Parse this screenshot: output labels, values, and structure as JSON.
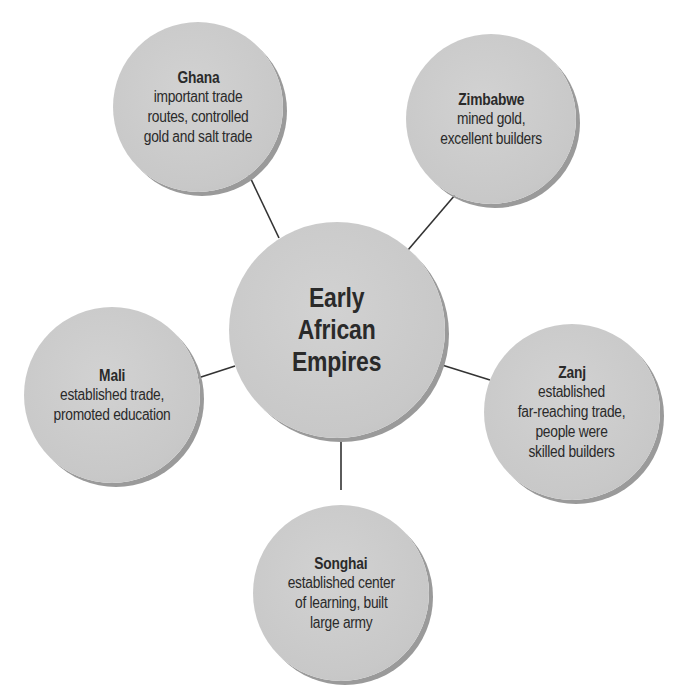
{
  "partial_title_cut_off": "",
  "diagram": {
    "type": "concept-web",
    "center": {
      "label": "Early\nAfrican\nEmpires",
      "cx": 337,
      "cy": 330,
      "r": 108
    },
    "nodes": [
      {
        "id": "ghana",
        "name": "Ghana",
        "description": "important trade\nroutes, controlled\ngold and salt trade",
        "cx": 198,
        "cy": 107,
        "r": 85,
        "link": {
          "x1": 249,
          "y1": 175,
          "x2": 279,
          "y2": 238
        }
      },
      {
        "id": "zimbabwe",
        "name": "Zimbabwe",
        "description": "mined gold,\nexcellent builders",
        "cx": 491,
        "cy": 119,
        "r": 85,
        "link": {
          "x1": 455,
          "y1": 195,
          "x2": 408,
          "y2": 250
        }
      },
      {
        "id": "mali",
        "name": "Mali",
        "description": "established trade,\npromoted education",
        "cx": 112,
        "cy": 395,
        "r": 88,
        "link": {
          "x1": 198,
          "y1": 378,
          "x2": 235,
          "y2": 366
        }
      },
      {
        "id": "zanj",
        "name": "Zanj",
        "description": "established\nfar-reaching trade,\npeople were\nskilled builders",
        "cx": 572,
        "cy": 412,
        "r": 88,
        "link": {
          "x1": 442,
          "y1": 365,
          "x2": 490,
          "y2": 380
        }
      },
      {
        "id": "songhai",
        "name": "Songhai",
        "description": "established center\nof learning, built\nlarge army",
        "cx": 341,
        "cy": 593,
        "r": 88,
        "link": {
          "x1": 341,
          "y1": 438,
          "x2": 341,
          "y2": 490
        }
      }
    ]
  },
  "colors": {
    "bubble_fill": "#c9c9c9",
    "bubble_shadow": "#9a9a9a",
    "text": "#2a2a2a",
    "connector": "#333333",
    "background": "#ffffff"
  }
}
